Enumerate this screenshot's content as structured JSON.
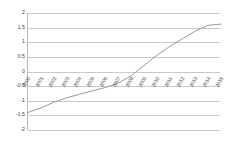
{
  "chart_data": {
    "type": "line",
    "title": "",
    "subtitle": "",
    "xlabel": "",
    "ylabel": "",
    "grid": true,
    "legend": false,
    "legend_position": "none",
    "ylim": [
      -2,
      2
    ],
    "yticks": [
      "2",
      "1.5",
      "1",
      "0.5",
      "0",
      "-0.5",
      "-1",
      "-1.5",
      "-2"
    ],
    "ytick_values": [
      2,
      1.5,
      1,
      0.5,
      0,
      -0.5,
      -1,
      -1.5,
      -2
    ],
    "categories": [
      "2000",
      "2001",
      "2002",
      "2003",
      "2004",
      "2005",
      "2006",
      "2007",
      "2008",
      "2009",
      "2010",
      "2011",
      "2012",
      "2013",
      "2014",
      "2015"
    ],
    "series": [
      {
        "name": "series-1",
        "color": "#9a9a9a",
        "values": [
          -1.4,
          -1.25,
          -1.05,
          -0.9,
          -0.78,
          -0.66,
          -0.55,
          -0.4,
          -0.15,
          0.2,
          0.55,
          0.85,
          1.12,
          1.38,
          1.58,
          1.62
        ]
      }
    ]
  },
  "colors": {
    "line": "#9a9a9a",
    "grid": "#c9c9c9",
    "axis": "#b9b9b9",
    "text": "#3f3f3f",
    "background": "#ffffff"
  }
}
